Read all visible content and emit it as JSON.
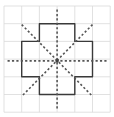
{
  "diagram": {
    "title": "",
    "grid": {
      "columns": 6,
      "rows": 6,
      "origin": [
        4,
        6
      ],
      "cell_size": 17.7,
      "line_color": "#d9d9d9"
    },
    "shape": {
      "type": "cross",
      "stroke_color": "#3a3a3a",
      "points_in_cells": [
        [
          2,
          1
        ],
        [
          4,
          1
        ],
        [
          4,
          2
        ],
        [
          5,
          2
        ],
        [
          5,
          4
        ],
        [
          4,
          4
        ],
        [
          4,
          5
        ],
        [
          2,
          5
        ],
        [
          2,
          4
        ],
        [
          1,
          4
        ],
        [
          1,
          2
        ],
        [
          2,
          2
        ]
      ]
    },
    "symmetry_lines": {
      "count": 4,
      "style": "dashed",
      "color": "#555555",
      "lines": [
        {
          "name": "vertical",
          "from": [
            3,
            0.2
          ],
          "to": [
            3,
            5.8
          ]
        },
        {
          "name": "horizontal",
          "from": [
            0.2,
            3.1
          ],
          "to": [
            5.8,
            3.1
          ]
        },
        {
          "name": "diagonal-down",
          "from": [
            1,
            1.05
          ],
          "to": [
            5,
            5.1
          ]
        },
        {
          "name": "diagonal-up",
          "from": [
            5,
            1.05
          ],
          "to": [
            1,
            5.1
          ]
        }
      ]
    },
    "center": [
      3,
      3.1
    ]
  }
}
